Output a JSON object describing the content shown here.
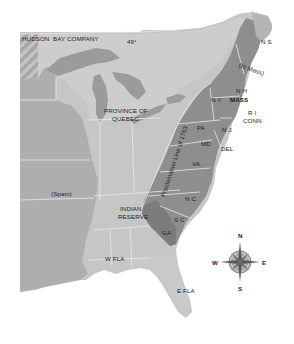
{
  "map": {
    "title_hidden": "",
    "colors": {
      "background": "#ffffff",
      "territory_light": "#c9c9c9",
      "territory_mid": "#b3b3b3",
      "colonies_dark": "#8c8c8c",
      "colonies_darker": "#7a7a7a",
      "lakes": "#9a9a9a",
      "borders": "#e6e6e6",
      "hatch": "#a9a9a9"
    },
    "labels": {
      "hudson": "HUDSON",
      "bay_company": "BAY COMPANY",
      "parallel": "49°",
      "quebec_line1": "PROVINCE OF",
      "quebec_line2": "QUEBEC",
      "spain": "(Spain)",
      "indian_line1": "INDIAN",
      "indian_line2": "RESERVE",
      "w_fla": "W FLA",
      "e_fla": "E FLA",
      "proclamation": "Proclamation Line of 1763",
      "ns": "N S",
      "to_mass": "(to Mass)",
      "nh": "N H",
      "ny": "N Y",
      "mass": "MASS",
      "ri": "R I",
      "conn": "CONN",
      "pa": "PA",
      "nj": "N J",
      "md": "MD",
      "del": "DEL",
      "va": "VA",
      "nc": "N C",
      "sc": "S C",
      "ga": "GA"
    },
    "compass": {
      "n": "N",
      "s": "S",
      "e": "E",
      "w": "W"
    }
  }
}
